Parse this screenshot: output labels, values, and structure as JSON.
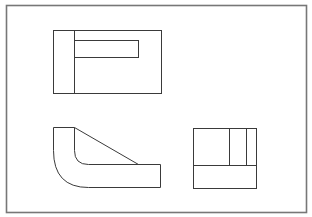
{
  "diagram": {
    "type": "orthographic-projection",
    "views": [
      {
        "name": "top-view",
        "description": "Rectangle with vertical division and inner slot rectangle"
      },
      {
        "name": "front-view",
        "description": "L-shaped profile with curved bend and diagonal rib"
      },
      {
        "name": "side-view",
        "description": "Rectangle divided by one horizontal and two vertical lines"
      }
    ],
    "colors": {
      "line": "#3a3a3a",
      "frame": "#777777",
      "background": "#ffffff"
    }
  }
}
